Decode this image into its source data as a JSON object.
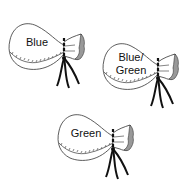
{
  "diagram": {
    "type": "illustration",
    "bags": [
      {
        "label_lines": [
          "Blue"
        ]
      },
      {
        "label_lines": [
          "Blue/",
          "Green"
        ]
      },
      {
        "label_lines": [
          "Green"
        ]
      }
    ]
  }
}
